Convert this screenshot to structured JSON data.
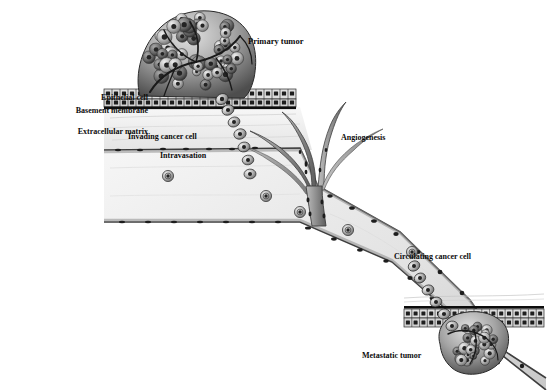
{
  "figure": {
    "kind": "biological-diagram",
    "background_color": "#ffffff",
    "ink_color": "#0b0b0b"
  },
  "labels": {
    "epithelial_cell": "Epithelial cell",
    "basement_membrane": "Basement membrane",
    "extracellular_matrix": "Extracellular matrix",
    "primary_tumor": "Primary tumor",
    "invading_cancer_cell": "Invading cancer cell",
    "intravasation": "Intravasation",
    "angiogenesis": "Angiogenesis",
    "circulating_cancer_cell": "Circulating cancer cell",
    "metastatic_tumor": "Metastatic tumor"
  },
  "label_layout": [
    {
      "key": "epithelial_cell",
      "x": 40,
      "y": 94,
      "align": "right",
      "width": 108,
      "size": 8.0
    },
    {
      "key": "basement_membrane",
      "x": 8,
      "y": 107,
      "align": "right",
      "width": 140,
      "size": 8.0
    },
    {
      "key": "extracellular_matrix",
      "x": 10,
      "y": 128,
      "align": "right",
      "width": 138,
      "size": 8.0
    },
    {
      "key": "primary_tumor",
      "x": 248,
      "y": 37,
      "align": "left",
      "width": 120,
      "size": 8.5
    },
    {
      "key": "invading_cancer_cell",
      "x": 128,
      "y": 133,
      "align": "left",
      "width": 130,
      "size": 8.0
    },
    {
      "key": "intravasation",
      "x": 160,
      "y": 152,
      "align": "left",
      "width": 100,
      "size": 8.0
    },
    {
      "key": "angiogenesis",
      "x": 341,
      "y": 134,
      "align": "left",
      "width": 100,
      "size": 8.0
    },
    {
      "key": "circulating_cancer_cell",
      "x": 394,
      "y": 253,
      "align": "left",
      "width": 140,
      "size": 8.0
    },
    {
      "key": "metastatic_tumor",
      "x": 362,
      "y": 352,
      "align": "left",
      "width": 110,
      "size": 8.0
    }
  ],
  "structures": {
    "primary_tumor": {
      "name": "Primary tumor mass",
      "center_x": 196,
      "center_y": 52,
      "radius_x": 58,
      "radius_y": 44,
      "cell_count": 46,
      "has_vasculature": true
    },
    "metastatic_tumor": {
      "name": "Metastatic tumor mass",
      "center_x": 472,
      "center_y": 352,
      "radius_x": 34,
      "radius_y": 28,
      "cell_count": 24,
      "has_vasculature": true
    },
    "upper_epithelium": {
      "name": "Upper epithelial sheet",
      "x": 104,
      "y": 89,
      "width": 192,
      "height": 18,
      "rows": 2,
      "columns": 24
    },
    "lower_epithelium": {
      "name": "Lower epithelial sheet",
      "x": 404,
      "y": 308,
      "width": 140,
      "height": 18,
      "rows": 2,
      "columns": 18
    },
    "blood_vessel": {
      "name": "Blood vessel lumen",
      "lumen_fill": "#e9e9e9",
      "wall_color": "#4a4a4a",
      "endothelial_nuclei": 38
    },
    "angiogenic_sprouts": {
      "name": "Angiogenic sprouting vessels",
      "branch_count": 5,
      "origin_x": 318,
      "origin_y": 190
    },
    "invading_chain": {
      "name": "Invading cancer cell chain",
      "cell_count": 7,
      "start": [
        222,
        99
      ],
      "end": [
        246,
        175
      ]
    },
    "extravasating_chain": {
      "name": "Extravasating cancer cell chain",
      "cell_count": 6,
      "start": [
        416,
        268
      ],
      "end": [
        456,
        330
      ]
    },
    "circulating_cells": {
      "name": "Circulating cancer cells in lumen",
      "count": 5,
      "positions": [
        [
          266,
          196
        ],
        [
          348,
          230
        ],
        [
          412,
          252
        ],
        [
          168,
          176
        ],
        [
          300,
          212
        ]
      ]
    }
  },
  "palette": {
    "tumor_light": "#d8d8d8",
    "tumor_mid": "#9a9a9a",
    "tumor_dark": "#3b3b3b",
    "nucleus": "#2b2b2b",
    "membrane": "#111111",
    "matrix": "#efefef",
    "lumen": "#ebebeb"
  }
}
